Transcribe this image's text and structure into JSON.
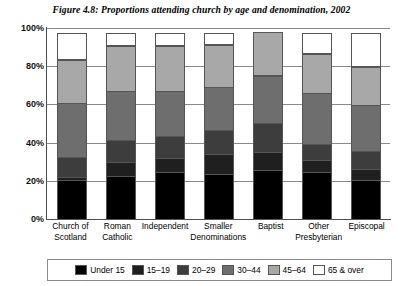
{
  "chart_data": {
    "type": "bar",
    "subtype": "stacked-100-percent",
    "title": "Figure 4.8: Proportions attending church by age and denomination, 2002",
    "xlabel": "",
    "ylabel": "",
    "ylim": [
      0,
      100
    ],
    "yticks": [
      "0%",
      "20%",
      "40%",
      "60%",
      "80%",
      "100%"
    ],
    "ytick_values": [
      0,
      20,
      40,
      60,
      80,
      100
    ],
    "grid": true,
    "legend_position": "bottom",
    "categories": [
      "Church of Scotland",
      "Roman Catholic",
      "Independent",
      "Smaller Denominations",
      "Baptist",
      "Other Presbyterian",
      "Episcopal"
    ],
    "series": [
      {
        "name": "Under 15",
        "color": "#000000",
        "values": [
          21,
          23,
          25,
          24,
          26,
          25,
          21
        ]
      },
      {
        "name": "15–19",
        "color": "#1f1f1f",
        "values": [
          2,
          8,
          8,
          11,
          10,
          7,
          6
        ]
      },
      {
        "name": "20–29",
        "color": "#3d3d3d",
        "values": [
          11,
          12,
          12,
          13,
          16,
          9,
          10
        ]
      },
      {
        "name": "30–44",
        "color": "#6e6e6e",
        "values": [
          29,
          26,
          24,
          23,
          25,
          27,
          25
        ]
      },
      {
        "name": "45–64",
        "color": "#a8a8a8",
        "values": [
          23,
          24,
          24,
          23,
          23,
          21,
          20
        ]
      },
      {
        "name": "65 & over",
        "color": "#ffffff",
        "values": [
          14,
          7,
          7,
          6,
          0,
          11,
          18
        ]
      }
    ]
  },
  "legend": {
    "items": [
      {
        "label": "Under 15",
        "color": "#000000"
      },
      {
        "label": "15–19",
        "color": "#1f1f1f"
      },
      {
        "label": "20–29",
        "color": "#3d3d3d"
      },
      {
        "label": "30–44",
        "color": "#6e6e6e"
      },
      {
        "label": "45–64",
        "color": "#a8a8a8"
      },
      {
        "label": "65 & over",
        "color": "#ffffff"
      }
    ]
  }
}
